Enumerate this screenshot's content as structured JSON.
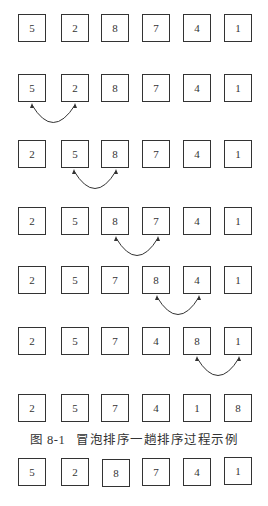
{
  "figure": {
    "caption": "图 8-1   冒泡排序一趟排序过程示例",
    "rows": [
      {
        "values": [
          "5",
          "2",
          "8",
          "7",
          "4",
          "1"
        ],
        "swap": null
      },
      {
        "values": [
          "5",
          "2",
          "8",
          "7",
          "4",
          "1"
        ],
        "swap": [
          0,
          1
        ]
      },
      {
        "values": [
          "2",
          "5",
          "8",
          "7",
          "4",
          "1"
        ],
        "swap": [
          1,
          2
        ]
      },
      {
        "values": [
          "2",
          "5",
          "8",
          "7",
          "4",
          "1"
        ],
        "swap": [
          2,
          3
        ]
      },
      {
        "values": [
          "2",
          "5",
          "7",
          "8",
          "4",
          "1"
        ],
        "swap": [
          3,
          4
        ]
      },
      {
        "values": [
          "2",
          "5",
          "7",
          "4",
          "8",
          "1"
        ],
        "swap": [
          4,
          5
        ]
      },
      {
        "values": [
          "2",
          "5",
          "7",
          "4",
          "1",
          "8"
        ],
        "swap": null
      }
    ],
    "after_caption_row": {
      "values": [
        "5",
        "2",
        "8",
        "7",
        "4",
        "1"
      ]
    }
  }
}
